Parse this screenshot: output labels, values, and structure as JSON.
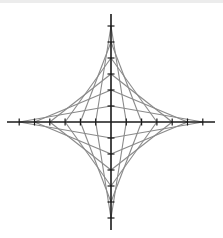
{
  "diagram": {
    "type": "string-art-astroid",
    "center": {
      "x": 111,
      "y": 122
    },
    "tick_spacing": {
      "x": 15.3,
      "y": 16.0
    },
    "ticks_per_half_axis": 6,
    "axis_extent": {
      "left": 7,
      "right": 215,
      "top": 14,
      "bottom": 230
    },
    "line_rule": "connect (k,0) to (0,7-k) for k=1..6 in each quadrant",
    "colors": {
      "axis": "#1a1a1a",
      "ticks": "#1a1a1a",
      "strings": "#8a8a8a",
      "background": "#ffffff"
    }
  }
}
